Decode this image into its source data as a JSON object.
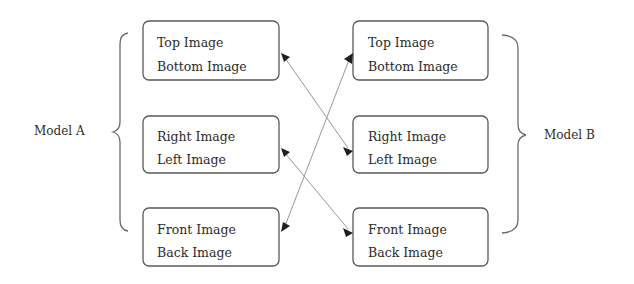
{
  "diagram": {
    "model_a": {
      "label": "Model A",
      "boxes": [
        {
          "line1": "Top Image",
          "line2": "Bottom Image"
        },
        {
          "line1": "Right Image",
          "line2": "Left Image"
        },
        {
          "line1": "Front Image",
          "line2": "Back Image"
        }
      ]
    },
    "model_b": {
      "label": "Model B",
      "boxes": [
        {
          "line1": "Top Image",
          "line2": "Bottom Image"
        },
        {
          "line1": "Right Image",
          "line2": "Left Image"
        },
        {
          "line1": "Front Image",
          "line2": "Back Image"
        }
      ]
    },
    "connections": [
      {
        "from": "Model A: Top/Bottom",
        "to": "Model B: Right/Left"
      },
      {
        "from": "Model A: Right/Left",
        "to": "Model B: Front/Back"
      },
      {
        "from": "Model A: Front/Back",
        "to": "Model B: Top/Bottom"
      }
    ],
    "colors": {
      "box_border": "#5a5a5a",
      "arrow_line": "#8a8a8a",
      "arrow_head": "#1f1f1f",
      "text": "#2b2b2b"
    }
  }
}
